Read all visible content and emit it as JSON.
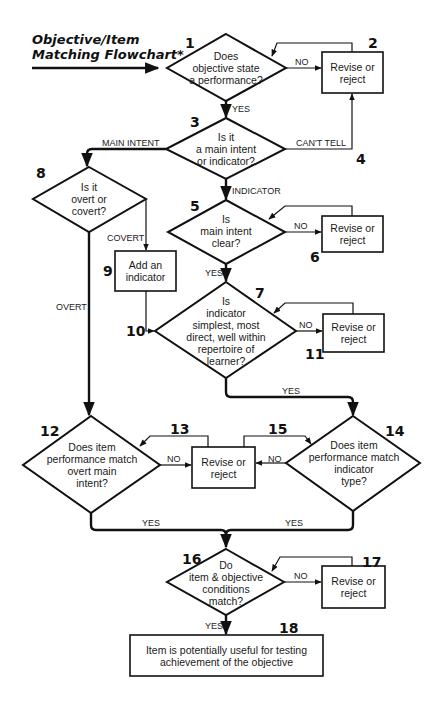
{
  "title": {
    "line1": "Objective/Item",
    "line2": "Matching Flowchart*"
  },
  "nodes": [
    {
      "id": 1,
      "type": "decision",
      "number": "1",
      "text": "Does\nobjective state\na performance?"
    },
    {
      "id": 2,
      "type": "process",
      "number": "2",
      "text": "Revise or\nreject"
    },
    {
      "id": 3,
      "type": "decision",
      "number": "3",
      "text": "Is it\na main intent\nor indicator?"
    },
    {
      "id": 4,
      "type": "connector",
      "number": "4"
    },
    {
      "id": 5,
      "type": "decision",
      "number": "5",
      "text": "Is\nmain intent\nclear?"
    },
    {
      "id": 6,
      "type": "process",
      "number": "6",
      "text": "Revise or\nreject"
    },
    {
      "id": 7,
      "type": "decision",
      "number": "7",
      "text": "Is\nindicator\nsimplest, most\ndirect, well within\nrepertoire of\nlearner?"
    },
    {
      "id": 8,
      "type": "decision",
      "number": "8",
      "text": "Is it\novert or\ncovert?"
    },
    {
      "id": 9,
      "type": "process",
      "number": "9",
      "text": "Add an\nindicator"
    },
    {
      "id": 10,
      "type": "connector",
      "number": "10"
    },
    {
      "id": 11,
      "type": "process",
      "number": "11",
      "text": "Revise or\nreject"
    },
    {
      "id": 12,
      "type": "decision",
      "number": "12",
      "text": "Does item\nperformance match\novert main\nintent?"
    },
    {
      "id": 13,
      "type": "process",
      "number": "13",
      "text": "Revise or\nreject"
    },
    {
      "id": 14,
      "type": "decision",
      "number": "14",
      "text": "Does item\nperformance match\nindicator\ntype?"
    },
    {
      "id": 15,
      "type": "connector",
      "number": "15"
    },
    {
      "id": 16,
      "type": "decision",
      "number": "16",
      "text": "Do\nitem & objective\nconditions\nmatch?"
    },
    {
      "id": 17,
      "type": "process",
      "number": "17",
      "text": "Revise or\nreject"
    },
    {
      "id": 18,
      "type": "terminal",
      "number": "18",
      "text": "Item is potentially useful for testing\nachievement of the objective"
    }
  ],
  "edges": [
    {
      "from": 1,
      "to": 2,
      "label": "NO"
    },
    {
      "from": 2,
      "to": 1,
      "label": ""
    },
    {
      "from": 1,
      "to": 3,
      "label": "YES"
    },
    {
      "from": 3,
      "to": 8,
      "label": "MAIN INTENT"
    },
    {
      "from": 3,
      "to": 2,
      "label": "CAN'T TELL"
    },
    {
      "from": 3,
      "to": 5,
      "label": "INDICATOR"
    },
    {
      "from": 5,
      "to": 6,
      "label": "NO"
    },
    {
      "from": 5,
      "to": 7,
      "label": "YES"
    },
    {
      "from": 8,
      "to": 9,
      "label": "COVERT"
    },
    {
      "from": 8,
      "to": 12,
      "label": "OVERT"
    },
    {
      "from": 9,
      "to": 7,
      "label": ""
    },
    {
      "from": 7,
      "to": 11,
      "label": "NO"
    },
    {
      "from": 7,
      "to": 14,
      "label": "YES"
    },
    {
      "from": 12,
      "to": 13,
      "label": "NO"
    },
    {
      "from": 14,
      "to": 13,
      "label": "NO"
    },
    {
      "from": 12,
      "to": 16,
      "label": "YES"
    },
    {
      "from": 14,
      "to": 16,
      "label": "YES"
    },
    {
      "from": 16,
      "to": 17,
      "label": "NO"
    },
    {
      "from": 16,
      "to": 18,
      "label": "YES"
    }
  ],
  "labels": {
    "no": "NO",
    "yes": "YES",
    "main_intent": "MAIN INTENT",
    "cant_tell": "CAN'T TELL",
    "indicator": "INDICATOR",
    "covert": "COVERT",
    "overt": "OVERT"
  }
}
